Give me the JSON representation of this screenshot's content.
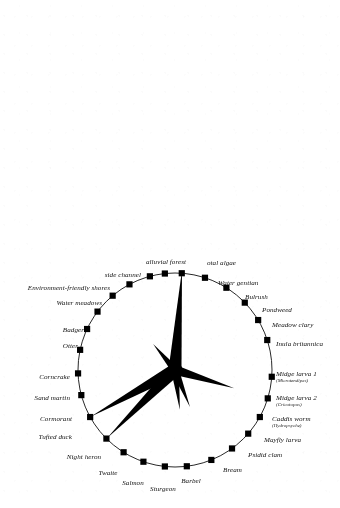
{
  "figure": {
    "type": "radial-star-plot",
    "background_color": "#ffffff",
    "ink_color": "#000000",
    "circle": {
      "cx": 175,
      "cy": 370,
      "r": 97,
      "stroke_width": 0.9
    },
    "node": {
      "shape": "square",
      "size": 6.2,
      "fill": "#000000"
    }
  },
  "chart_data": {
    "type": "scatter",
    "title": "",
    "xlabel": "",
    "ylabel": "",
    "grid": false,
    "legend": null,
    "categories": [
      "Total algae",
      "Water gentian",
      "Bulrush",
      "Pondweed",
      "Meadow clary",
      "Inula britannica",
      "Midge larva 1",
      "Midge larva 2",
      "Caddis worm",
      "Mayfly larva",
      "Psidid clam",
      "Bream",
      "Barbel",
      "Sturgeon",
      "Salmon",
      "Twaite",
      "Night heron",
      "Tufted duck",
      "Cormorant",
      "Sand martin",
      "Corncrake",
      "Otter",
      "Badger",
      "Water meadows",
      "Environment-friendly shores",
      "side channel",
      "alluvial forest"
    ],
    "values": [
      100,
      4,
      4,
      4,
      4,
      4,
      8,
      62,
      6,
      5,
      5,
      40,
      40,
      4,
      4,
      4,
      96,
      96,
      6,
      4,
      4,
      5,
      6,
      34,
      8,
      6,
      5
    ],
    "note": "values are spike lengths in px measured from the circle centre; 97 px equals the circle radius"
  },
  "nodes": [
    {
      "id": "total-algae",
      "label": "otal algae",
      "sub": "",
      "angle": -86,
      "anchor": "r",
      "lx": 207,
      "ly": 263
    },
    {
      "id": "water-gentian",
      "label": "Water gentian",
      "sub": "",
      "angle": -72,
      "anchor": "r",
      "lx": 218,
      "ly": 283
    },
    {
      "id": "bulrush",
      "label": "Bulrush",
      "sub": "",
      "angle": -58,
      "anchor": "r",
      "lx": 245,
      "ly": 297
    },
    {
      "id": "pondweed",
      "label": "Pondweed",
      "sub": "",
      "angle": -44,
      "anchor": "r",
      "lx": 262,
      "ly": 310
    },
    {
      "id": "meadow-clary",
      "label": "Meadow clary",
      "sub": "",
      "angle": -31,
      "anchor": "r",
      "lx": 272,
      "ly": 325
    },
    {
      "id": "inula",
      "label": "Inula britannica",
      "sub": "",
      "angle": -18,
      "anchor": "r",
      "lx": 276,
      "ly": 344
    },
    {
      "id": "midge-1",
      "label": "Midge larva 1",
      "sub": "(Microtendipes)",
      "angle": 4,
      "anchor": "r",
      "lx": 276,
      "ly": 377
    },
    {
      "id": "midge-2",
      "label": "Midge larva 2",
      "sub": "(Cricotopus)",
      "angle": 17,
      "anchor": "r",
      "lx": 276,
      "ly": 401
    },
    {
      "id": "caddis-worm",
      "label": "Caddis worm",
      "sub": "(Hydropsyche)",
      "angle": 29,
      "anchor": "r",
      "lx": 272,
      "ly": 422
    },
    {
      "id": "mayfly-larva",
      "label": "Mayfly larva",
      "sub": "",
      "angle": 41,
      "anchor": "r",
      "lx": 264,
      "ly": 440
    },
    {
      "id": "psidid-clam",
      "label": "Psidid clam",
      "sub": "",
      "angle": 54,
      "anchor": "r",
      "lx": 248,
      "ly": 455
    },
    {
      "id": "bream",
      "label": "Bream",
      "sub": "",
      "angle": 68,
      "anchor": "r",
      "lx": 223,
      "ly": 470
    },
    {
      "id": "barbel",
      "label": "Barbel",
      "sub": "",
      "angle": 83,
      "anchor": "c",
      "lx": 191,
      "ly": 481
    },
    {
      "id": "sturgeon",
      "label": "Sturgeon",
      "sub": "",
      "angle": 96,
      "anchor": "c",
      "lx": 163,
      "ly": 489
    },
    {
      "id": "salmon",
      "label": "Salmon",
      "sub": "",
      "angle": 109,
      "anchor": "c",
      "lx": 133,
      "ly": 483
    },
    {
      "id": "twaite",
      "label": "Twaite",
      "sub": "",
      "angle": 122,
      "anchor": "c",
      "lx": 108,
      "ly": 473
    },
    {
      "id": "night-heron",
      "label": "Night heron",
      "sub": "",
      "angle": 135,
      "anchor": "c",
      "lx": 84,
      "ly": 457
    },
    {
      "id": "tufted-duck",
      "label": "Tufted duck",
      "sub": "",
      "angle": 151,
      "anchor": "l",
      "lx": 72,
      "ly": 437
    },
    {
      "id": "cormorant",
      "label": "Cormorant",
      "sub": "",
      "angle": 165,
      "anchor": "l",
      "lx": 72,
      "ly": 419
    },
    {
      "id": "sand-martin",
      "label": "Sand martin",
      "sub": "",
      "angle": 178,
      "anchor": "l",
      "lx": 70,
      "ly": 398
    },
    {
      "id": "corncrake",
      "label": "Corncrake",
      "sub": "",
      "angle": -168,
      "anchor": "l",
      "lx": 70,
      "ly": 377
    },
    {
      "id": "otter",
      "label": "Otter",
      "sub": "",
      "angle": -155,
      "anchor": "l",
      "lx": 78,
      "ly": 346
    },
    {
      "id": "badger",
      "label": "Badger",
      "sub": "",
      "angle": -143,
      "anchor": "l",
      "lx": 84,
      "ly": 330
    },
    {
      "id": "water-meadows",
      "label": "Water meadows",
      "sub": "",
      "angle": -130,
      "anchor": "l",
      "lx": 102,
      "ly": 303
    },
    {
      "id": "env-shores",
      "label": "Environment-friendly shores",
      "sub": "",
      "angle": -118,
      "anchor": "l",
      "lx": 110,
      "ly": 288
    },
    {
      "id": "side-channel",
      "label": "side channel",
      "sub": "",
      "angle": -105,
      "anchor": "l",
      "lx": 141,
      "ly": 275
    },
    {
      "id": "alluvial",
      "label": "alluvial forest",
      "sub": "",
      "angle": -96,
      "anchor": "c",
      "lx": 166,
      "ly": 262
    }
  ]
}
